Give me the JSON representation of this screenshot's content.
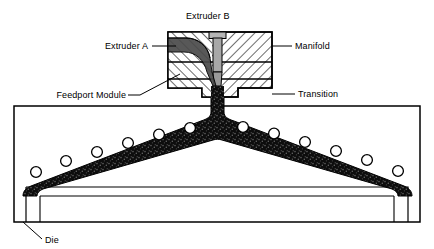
{
  "diagram": {
    "type": "cross-section-schematic",
    "title": "Extruder B",
    "labels": {
      "extruder_b": "Extruder B",
      "extruder_a": "Extruder A",
      "feedport_module": "Feedport Module",
      "manifold": "Manifold",
      "transition": "Transition",
      "die": "Die"
    },
    "colors": {
      "outline": "#000000",
      "melt_flow": "#1a1a1a",
      "extruder_b_channel": "#a8a8a8",
      "hatch": "#000000",
      "background": "#ffffff"
    },
    "components": [
      {
        "name": "Extruder B",
        "kind": "inlet-port",
        "position": "top-center",
        "shading": "solid-gray"
      },
      {
        "name": "Extruder A",
        "kind": "inlet-port",
        "position": "upper-left",
        "shading": "dark-melt"
      },
      {
        "name": "Manifold",
        "kind": "block-section",
        "position": "upper-right",
        "shading": "cross-hatch"
      },
      {
        "name": "Feedport Module",
        "kind": "block-section",
        "position": "middle-left",
        "shading": "cross-hatch"
      },
      {
        "name": "Transition",
        "kind": "block-section",
        "position": "lower-right",
        "shading": "cross-hatch"
      },
      {
        "name": "Die",
        "kind": "body",
        "position": "bottom",
        "shading": "outline"
      }
    ],
    "bolt_holes": {
      "count_left": 7,
      "count_right": 7,
      "total": 14,
      "shape": "circle"
    }
  }
}
